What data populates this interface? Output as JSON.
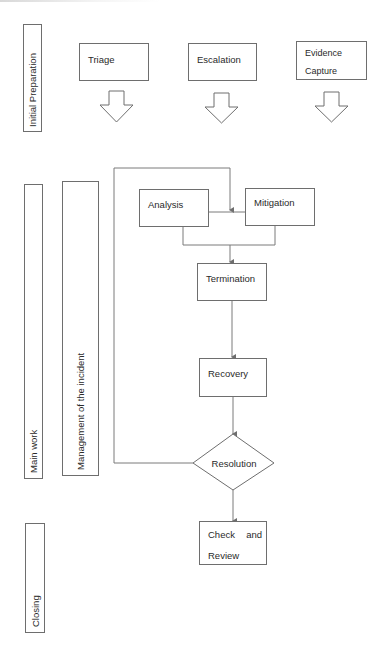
{
  "diagram": {
    "type": "incident-response-flowchart",
    "line_color": "#6e6e6e",
    "text_color": "#2a2a2a",
    "phases": [
      {
        "id": "initial",
        "label": "Initial Preparation"
      },
      {
        "id": "main",
        "label": "Main work"
      },
      {
        "id": "closing",
        "label": "Closing"
      }
    ],
    "sub_lane": {
      "label": "Management of the incident"
    },
    "preparation_steps": [
      {
        "label": "Triage"
      },
      {
        "label": "Escalation"
      },
      {
        "label_line1": "Evidence",
        "label_line2": "Capture"
      }
    ],
    "nodes": {
      "analysis": "Analysis",
      "mitigation": "Mitigation",
      "termination": "Termination",
      "recovery": "Recovery",
      "resolution": "Resolution",
      "check_review_word1": "Check",
      "check_review_word2": "and",
      "check_review_line2": "Review"
    },
    "edges": [
      {
        "from": "Analysis",
        "to": "Termination"
      },
      {
        "from": "Mitigation",
        "to": "Termination"
      },
      {
        "from": "Analysis",
        "to": "Mitigation"
      },
      {
        "from": "Termination",
        "to": "Recovery"
      },
      {
        "from": "Recovery",
        "to": "Resolution"
      },
      {
        "from": "Resolution",
        "to": "Analysis/Mitigation (loop back)"
      },
      {
        "from": "Resolution",
        "to": "Check and Review"
      }
    ]
  }
}
